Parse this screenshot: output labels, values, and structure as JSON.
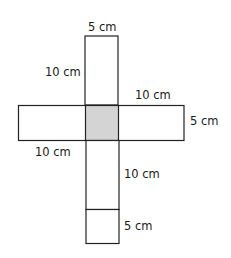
{
  "diagram": {
    "type": "cube-net",
    "colors": {
      "stroke": "#222222",
      "fill": "#ffffff",
      "shaded": "#d4d4d4"
    },
    "labels": {
      "top_width": "5 cm",
      "top_height": "10 cm",
      "right_length": "10 cm",
      "right_height": "5 cm",
      "left_length": "10 cm",
      "bottom_height": "10 cm",
      "bottom_square": "5 cm"
    }
  }
}
